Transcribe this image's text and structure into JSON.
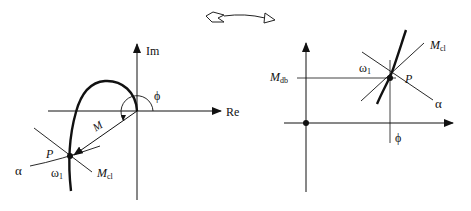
{
  "figure": {
    "transform_arrow": "nyquist-to-nichols",
    "left_plot": {
      "type": "nyquist",
      "axis_im": "Im",
      "axis_re": "Re",
      "phase_label": "ϕ",
      "magnitude_label": "M",
      "point_label": "P",
      "freq_label": "ω",
      "freq_sub": "1",
      "alpha_label": "α",
      "mcl_label": "M",
      "mcl_sub": "cl"
    },
    "right_plot": {
      "type": "nichols",
      "mdb_label": "M",
      "mdb_sub": "db",
      "phase_label": "ϕ",
      "point_label": "P",
      "freq_label": "ω",
      "freq_sub": "1",
      "alpha_label": "α",
      "mcl_label": "M",
      "mcl_sub": "cl"
    }
  }
}
